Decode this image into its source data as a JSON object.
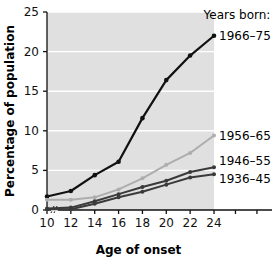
{
  "chart_data": {
    "type": "line",
    "title": "",
    "xlabel": "Age of onset",
    "ylabel": "Percentage of population",
    "legend_title": "Years born:",
    "legend_position": "right-inline",
    "grid": true,
    "grid_color": "#ffffff",
    "plot_background": "#e0e0e0",
    "x": [
      10,
      12,
      14,
      16,
      18,
      20,
      22,
      24
    ],
    "xlim": [
      10,
      24
    ],
    "ylim": [
      0,
      25
    ],
    "xticks": [
      "10",
      "12",
      "14",
      "16",
      "18",
      "20",
      "22",
      "24"
    ],
    "yticks": [
      "0",
      "5",
      "10",
      "15",
      "20",
      "25"
    ],
    "y_axis_break": true,
    "series": [
      {
        "name": "1966–75",
        "color": "#111111",
        "values": [
          1.7,
          2.4,
          4.4,
          6.1,
          11.6,
          16.4,
          19.5,
          22.0
        ]
      },
      {
        "name": "1956–65",
        "color": "#adadad",
        "values": [
          1.3,
          1.3,
          1.6,
          2.6,
          4.0,
          5.7,
          7.2,
          9.4
        ]
      },
      {
        "name": "1946–55",
        "color": "#3a3a3a",
        "values": [
          0.2,
          0.3,
          1.1,
          2.0,
          2.9,
          3.7,
          4.8,
          5.4
        ]
      },
      {
        "name": "1936–45",
        "color": "#3a3a3a",
        "values": [
          0.1,
          0.1,
          0.8,
          1.6,
          2.3,
          3.2,
          4.1,
          4.5
        ]
      }
    ]
  }
}
